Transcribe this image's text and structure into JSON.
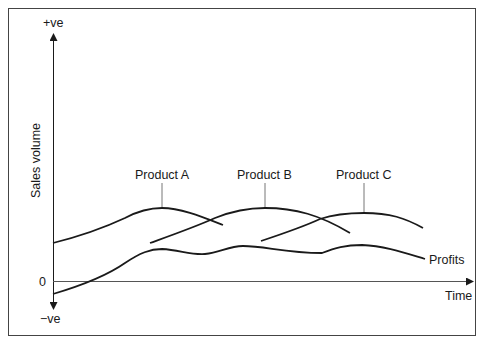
{
  "diagram": {
    "type": "product life cycle / sales volume over time",
    "y_axis": {
      "label": "Sales volume",
      "top_label": "+ve",
      "zero_label": "0",
      "bottom_label": "−ve"
    },
    "x_axis": {
      "label": "Time"
    },
    "curves": [
      {
        "name": "Product A",
        "label": "Product A"
      },
      {
        "name": "Product B",
        "label": "Product B"
      },
      {
        "name": "Product C",
        "label": "Product C"
      },
      {
        "name": "Profits",
        "label": "Profits"
      }
    ],
    "colors": {
      "line": "#1a1a1a",
      "leader": "#777777",
      "frame": "#444444",
      "background": "#ffffff"
    }
  }
}
